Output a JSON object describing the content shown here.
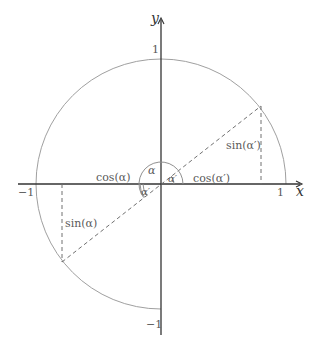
{
  "diagram": {
    "axes": {
      "x_label": "x",
      "y_label": "y",
      "ticks": {
        "x_pos": "1",
        "x_neg": "−1",
        "y_pos": "1",
        "y_neg": "−1"
      }
    },
    "labels": {
      "alpha": "α",
      "alpha_prime_upper": "α′",
      "alpha_prime_lower": "α′",
      "cos_alpha": "cos(α)",
      "sin_alpha": "sin(α)",
      "cos_alpha_prime": "cos(α′)",
      "sin_alpha_prime": "sin(α′)"
    },
    "colors": {
      "axis": "#333333",
      "circle": "#a0a0a0",
      "dashed": "#707070",
      "text": "#5a5a5a"
    }
  }
}
